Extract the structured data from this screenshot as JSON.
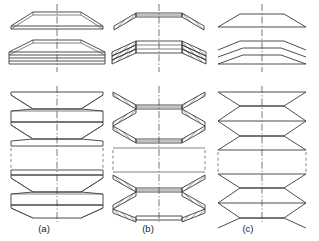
{
  "figure": {
    "background_color": "#ffffff",
    "line_color": "#3a3a3a",
    "axis_color": "#555555",
    "width": 319,
    "height": 241,
    "columns": [
      {
        "id": "a",
        "label": "(a)",
        "label_x": 44,
        "label_y": 230,
        "style": "outline-view",
        "description": "Outline (unsectioned) representation of disc springs",
        "center_x": 57,
        "rows": [
          {
            "name": "single-disc",
            "kind": "single",
            "count": 1
          },
          {
            "name": "parallel-stack",
            "kind": "parallel",
            "count": 3
          },
          {
            "name": "series-stack",
            "kind": "series",
            "count": 6,
            "has_break": true
          }
        ]
      },
      {
        "id": "b",
        "label": "(b)",
        "label_x": 148,
        "label_y": 230,
        "style": "sectioned-hatched-view",
        "description": "Sectional representation with 45 degree hatching",
        "center_x": 159,
        "rows": [
          {
            "name": "single-disc",
            "kind": "single",
            "count": 1
          },
          {
            "name": "parallel-stack",
            "kind": "parallel",
            "count": 3
          },
          {
            "name": "series-stack",
            "kind": "series",
            "count": 6,
            "has_break": true
          }
        ]
      },
      {
        "id": "c",
        "label": "(c)",
        "label_x": 248,
        "label_y": 230,
        "style": "simplified-line-view",
        "description": "Simplified single-line schematic representation",
        "center_x": 262,
        "rows": [
          {
            "name": "single-disc",
            "kind": "single",
            "count": 1
          },
          {
            "name": "parallel-stack",
            "kind": "parallel",
            "count": 3
          },
          {
            "name": "series-stack",
            "kind": "series",
            "count": 6,
            "has_break": true
          }
        ]
      }
    ],
    "annotations": {
      "centerline_style": "dash-dot",
      "break_style": "dashed-interrupt",
      "hatch_angle_deg": 45
    }
  }
}
